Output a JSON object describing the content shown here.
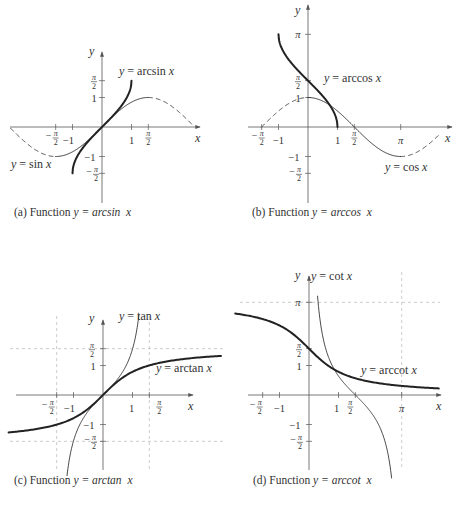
{
  "chart_data": [
    {
      "type": "line",
      "id": "a",
      "caption": "(a) Function y = arcsin x",
      "caption_parts": {
        "prefix": "(a) Function ",
        "func": "y = arcsin",
        "var": "x"
      },
      "xlabel": "x",
      "ylabel": "y",
      "x_ticks": [
        "−π/2",
        "−1",
        "1",
        "π/2"
      ],
      "y_ticks": [
        "π/2",
        "1",
        "−1",
        "−π/2"
      ],
      "series": [
        {
          "name": "y = sin x",
          "style": "thin, dashed outside [−π/2, π/2]",
          "domain": [
            -3.2,
            3.2
          ]
        },
        {
          "name": "y = arcsin x",
          "style": "thick",
          "domain": [
            -1,
            1
          ],
          "range": [
            -1.5708,
            1.5708
          ]
        }
      ],
      "annotations": [
        "y = arcsin x",
        "y = sin x"
      ]
    },
    {
      "type": "line",
      "id": "b",
      "caption": "(b) Function y = arccos x",
      "caption_parts": {
        "prefix": "(b) Function ",
        "func": "y = arccos",
        "var": "x"
      },
      "xlabel": "x",
      "ylabel": "y",
      "x_ticks": [
        "−π/2",
        "−1",
        "1",
        "π/2",
        "π"
      ],
      "y_ticks": [
        "π",
        "π/2",
        "1",
        "−1",
        "−π/2"
      ],
      "series": [
        {
          "name": "y = cos x",
          "style": "thin, dashed outside [0, π]",
          "domain": [
            -1.5708,
            4.6
          ]
        },
        {
          "name": "y = arccos x",
          "style": "thick",
          "domain": [
            -1,
            1
          ],
          "range": [
            0,
            3.1416
          ]
        }
      ],
      "annotations": [
        "y = arccos x",
        "y = cos x"
      ]
    },
    {
      "type": "line",
      "id": "c",
      "caption": "(c) Function y = arctan x",
      "caption_parts": {
        "prefix": "(c) Function ",
        "func": "y = arctan",
        "var": "x"
      },
      "xlabel": "x",
      "ylabel": "y",
      "x_ticks": [
        "−π/2",
        "−1",
        "1",
        "π/2"
      ],
      "y_ticks": [
        "π/2",
        "1",
        "−1",
        "−π/2"
      ],
      "asymptotes": {
        "x": [
          -1.5708,
          1.5708
        ],
        "y": [
          -1.5708,
          1.5708
        ]
      },
      "series": [
        {
          "name": "y = tan x",
          "style": "thin",
          "domain": [
            -1.5708,
            1.5708
          ]
        },
        {
          "name": "y = arctan x",
          "style": "thick",
          "domain": [
            -3.3,
            4.2
          ]
        }
      ],
      "annotations": [
        "y = tan x",
        "y = arctan x"
      ]
    },
    {
      "type": "line",
      "id": "d",
      "caption": "(d) Function y = arccot x",
      "caption_parts": {
        "prefix": "(d) Function ",
        "func": "y = arccot",
        "var": "x"
      },
      "xlabel": "x",
      "ylabel": "y",
      "x_ticks": [
        "−π/2",
        "−1",
        "1",
        "π/2",
        "π"
      ],
      "y_ticks": [
        "π",
        "π/2",
        "1",
        "−1",
        "−π/2"
      ],
      "asymptotes": {
        "x": [
          3.1416
        ],
        "y": [
          3.1416
        ]
      },
      "series": [
        {
          "name": "y = cot x",
          "style": "thin",
          "domain": [
            0,
            3.1416
          ]
        },
        {
          "name": "y = arccot x",
          "style": "thick",
          "domain": [
            -2.5,
            4.5
          ]
        }
      ],
      "annotations": [
        "y = cot x",
        "y = arccot x"
      ]
    }
  ],
  "captions": {
    "a": {
      "prefix": "(a) Function ",
      "func": "y = arcsin",
      "var": "x"
    },
    "b": {
      "prefix": "(b) Function ",
      "func": "y = arccos",
      "var": "x"
    },
    "c": {
      "prefix": "(c) Function ",
      "func": "y = arctan",
      "var": "x"
    },
    "d": {
      "prefix": "(d) Function ",
      "func": "y = arccot",
      "var": "x"
    }
  },
  "labels": {
    "x": "x",
    "y": "y",
    "pi": "π",
    "pi_half_num": "π",
    "pi_half_den": "2",
    "one": "1",
    "neg_one": "−1",
    "minus": "−",
    "a_arcsin": "y = arcsin",
    "a_sin": "y = sin",
    "b_arccos": "y = arccos",
    "b_cos": "y = cos",
    "c_tan": "y = tan",
    "c_arctan": "y = arctan",
    "d_cot": "y = cot",
    "d_arccot": "y = arccot"
  }
}
